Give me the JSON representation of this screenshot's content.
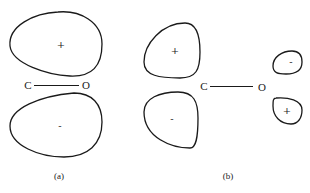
{
  "diagram": {
    "panels": [
      {
        "id": "a",
        "caption": "(a)",
        "bond": {
          "left_atom": "C",
          "right_atom": "O"
        },
        "lobes": [
          {
            "position": "upper",
            "sign": "+"
          },
          {
            "position": "lower",
            "sign": "-"
          }
        ]
      },
      {
        "id": "b",
        "caption": "(b)",
        "bond": {
          "left_atom": "C",
          "right_atom": "O"
        },
        "lobes": [
          {
            "position": "carbon-upper",
            "sign": "+"
          },
          {
            "position": "carbon-lower",
            "sign": "-"
          },
          {
            "position": "oxygen-upper",
            "sign": "-"
          },
          {
            "position": "oxygen-lower",
            "sign": "+"
          }
        ]
      }
    ]
  }
}
